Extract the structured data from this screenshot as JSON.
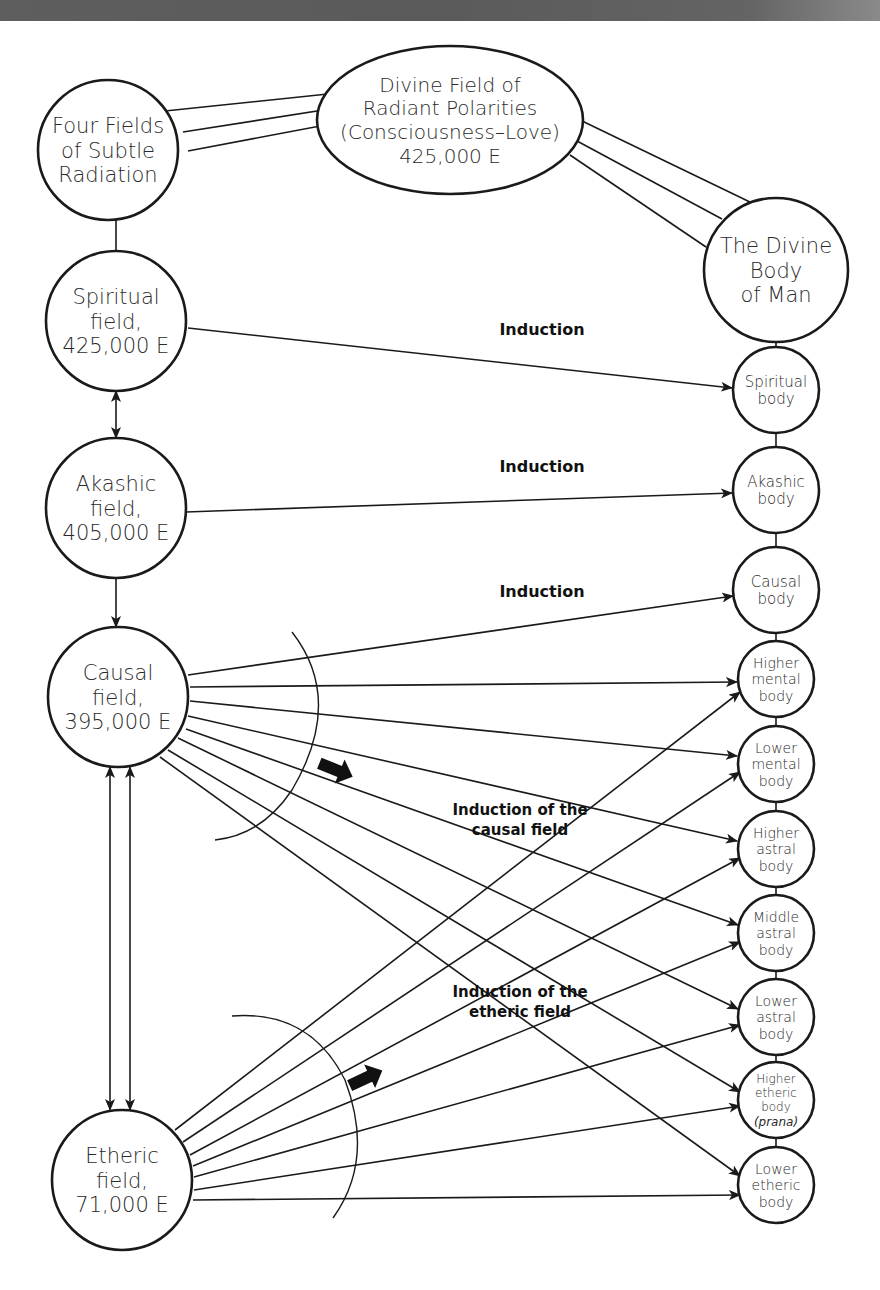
{
  "diagram": {
    "background": "#ffffff",
    "stroke_color": "#1a1a1a",
    "top_band_color": "#5a5a5a",
    "nodes": [
      {
        "id": "four_fields",
        "shape": "circle",
        "cx": 108,
        "cy": 150,
        "r": 70,
        "font_size": 21,
        "lines": [
          "Four Fields",
          "of Subtle",
          "Radiation"
        ]
      },
      {
        "id": "divine_field",
        "shape": "ellipse",
        "cx": 450,
        "cy": 120,
        "rx": 133,
        "ry": 74,
        "font_size": 20,
        "lines": [
          "Divine Field of",
          "Radiant Polarities",
          "(Consciousness–Love)",
          "425,000 E"
        ]
      },
      {
        "id": "divine_body",
        "shape": "circle",
        "cx": 776,
        "cy": 270,
        "r": 72,
        "font_size": 21,
        "lines": [
          "The Divine",
          "Body",
          "of Man"
        ]
      },
      {
        "id": "spiritual_field",
        "shape": "circle",
        "cx": 116,
        "cy": 321,
        "r": 70,
        "font_size": 21,
        "lines": [
          "Spiritual",
          "field,",
          "425,000 E"
        ]
      },
      {
        "id": "akashic_field",
        "shape": "circle",
        "cx": 116,
        "cy": 508,
        "r": 70,
        "font_size": 21,
        "lines": [
          "Akashic",
          "field,",
          "405,000 E"
        ]
      },
      {
        "id": "causal_field",
        "shape": "circle",
        "cx": 118,
        "cy": 697,
        "r": 70,
        "font_size": 21,
        "lines": [
          "Causal",
          "field,",
          "395,000 E"
        ]
      },
      {
        "id": "etheric_field",
        "shape": "circle",
        "cx": 122,
        "cy": 1180,
        "r": 70,
        "font_size": 21,
        "lines": [
          "Etheric",
          "field,",
          "71,000 E"
        ]
      },
      {
        "id": "spiritual_body",
        "shape": "circle",
        "cx": 776,
        "cy": 390,
        "r": 43,
        "font_size": 15,
        "lines": [
          "Spiritual",
          "body"
        ]
      },
      {
        "id": "akashic_body",
        "shape": "circle",
        "cx": 776,
        "cy": 490,
        "r": 43,
        "font_size": 15,
        "lines": [
          "Akashic",
          "body"
        ]
      },
      {
        "id": "causal_body",
        "shape": "circle",
        "cx": 776,
        "cy": 590,
        "r": 43,
        "font_size": 15,
        "lines": [
          "Causal",
          "body"
        ]
      },
      {
        "id": "higher_mental_body",
        "shape": "circle",
        "cx": 776,
        "cy": 679,
        "r": 38,
        "font_size": 14,
        "lines": [
          "Higher",
          "mental",
          "body"
        ]
      },
      {
        "id": "lower_mental_body",
        "shape": "circle",
        "cx": 776,
        "cy": 764,
        "r": 38,
        "font_size": 14,
        "lines": [
          "Lower",
          "mental",
          "body"
        ]
      },
      {
        "id": "higher_astral_body",
        "shape": "circle",
        "cx": 776,
        "cy": 849,
        "r": 38,
        "font_size": 14,
        "lines": [
          "Higher",
          "astral",
          "body"
        ]
      },
      {
        "id": "middle_astral_body",
        "shape": "circle",
        "cx": 776,
        "cy": 933,
        "r": 38,
        "font_size": 14,
        "lines": [
          "Middle",
          "astral",
          "body"
        ]
      },
      {
        "id": "lower_astral_body",
        "shape": "circle",
        "cx": 776,
        "cy": 1017,
        "r": 38,
        "font_size": 14,
        "lines": [
          "Lower",
          "astral",
          "body"
        ]
      },
      {
        "id": "higher_etheric_body",
        "shape": "circle",
        "cx": 776,
        "cy": 1100,
        "r": 38,
        "font_size": 12,
        "lines": [
          "Higher",
          "etheric",
          "body",
          "(prana)"
        ],
        "italic_last": true
      },
      {
        "id": "lower_etheric_body",
        "shape": "circle",
        "cx": 776,
        "cy": 1185,
        "r": 38,
        "font_size": 14,
        "lines": [
          "Lower",
          "etheric",
          "body"
        ]
      }
    ],
    "labels": [
      {
        "id": "induction_1",
        "x": 542,
        "y": 335,
        "font_size": 16,
        "lines": [
          "Induction"
        ]
      },
      {
        "id": "induction_2",
        "x": 542,
        "y": 472,
        "font_size": 16,
        "lines": [
          "Induction"
        ]
      },
      {
        "id": "induction_3",
        "x": 542,
        "y": 597,
        "font_size": 16,
        "lines": [
          "Induction"
        ]
      },
      {
        "id": "induction_causal",
        "x": 520,
        "y": 815,
        "font_size": 15,
        "lines": [
          "Induction of the",
          "causal field"
        ]
      },
      {
        "id": "induction_etheric",
        "x": 520,
        "y": 997,
        "font_size": 15,
        "lines": [
          "Induction of the",
          "etheric field"
        ]
      }
    ],
    "plain_lines": [
      [
        165,
        111,
        347,
        92
      ],
      [
        183,
        132,
        349,
        106
      ],
      [
        188,
        151,
        352,
        120
      ],
      [
        580,
        120,
        752,
        203
      ],
      [
        577,
        141,
        722,
        219
      ],
      [
        570,
        155,
        706,
        247
      ],
      [
        116,
        220,
        116,
        251
      ],
      [
        776,
        342,
        776,
        347
      ],
      [
        776,
        433,
        776,
        447
      ],
      [
        776,
        533,
        776,
        547
      ],
      [
        776,
        633,
        776,
        641
      ],
      [
        776,
        717,
        776,
        726
      ],
      [
        776,
        802,
        776,
        811
      ],
      [
        776,
        887,
        776,
        895
      ],
      [
        776,
        971,
        776,
        979
      ],
      [
        776,
        1055,
        776,
        1062
      ],
      [
        776,
        1138,
        776,
        1147
      ]
    ],
    "arrows": [
      {
        "from": [
          188,
          328
        ],
        "to": [
          732,
          388
        ],
        "ends": "end"
      },
      {
        "from": [
          186,
          512
        ],
        "to": [
          732,
          493
        ],
        "ends": "end"
      },
      {
        "from": [
          116,
          391
        ],
        "to": [
          116,
          438
        ],
        "ends": "both"
      },
      {
        "from": [
          116,
          578
        ],
        "to": [
          116,
          627
        ],
        "ends": "end"
      },
      {
        "from": [
          110,
          1110
        ],
        "to": [
          110,
          767
        ],
        "ends": "both"
      },
      {
        "from": [
          130,
          1110
        ],
        "to": [
          130,
          767
        ],
        "ends": "both"
      },
      {
        "from": [
          188,
          675
        ],
        "to": [
          733,
          596
        ],
        "ends": "end"
      },
      {
        "from": [
          190,
          687
        ],
        "to": [
          737,
          682
        ],
        "ends": "end"
      },
      {
        "from": [
          190,
          701
        ],
        "to": [
          737,
          756
        ],
        "ends": "end"
      },
      {
        "from": [
          188,
          716
        ],
        "to": [
          737,
          841
        ],
        "ends": "end"
      },
      {
        "from": [
          186,
          729
        ],
        "to": [
          738,
          925
        ],
        "ends": "end"
      },
      {
        "from": [
          178,
          738
        ],
        "to": [
          738,
          1009
        ],
        "ends": "end"
      },
      {
        "from": [
          168,
          750
        ],
        "to": [
          740,
          1092
        ],
        "ends": "end"
      },
      {
        "from": [
          160,
          757
        ],
        "to": [
          740,
          1176
        ],
        "ends": "end"
      },
      {
        "from": [
          175,
          1130
        ],
        "to": [
          740,
          692
        ],
        "ends": "end"
      },
      {
        "from": [
          183,
          1142
        ],
        "to": [
          740,
          772
        ],
        "ends": "end"
      },
      {
        "from": [
          190,
          1155
        ],
        "to": [
          740,
          858
        ],
        "ends": "end"
      },
      {
        "from": [
          193,
          1166
        ],
        "to": [
          740,
          942
        ],
        "ends": "end"
      },
      {
        "from": [
          194,
          1177
        ],
        "to": [
          740,
          1025
        ],
        "ends": "end"
      },
      {
        "from": [
          194,
          1190
        ],
        "to": [
          740,
          1106
        ],
        "ends": "end"
      },
      {
        "from": [
          193,
          1200
        ],
        "to": [
          740,
          1195
        ],
        "ends": "end"
      }
    ],
    "arcs": [
      {
        "id": "causal_arc",
        "d": "M 292 632 Q 345 700 292 790 Q 262 835 215 840"
      },
      {
        "id": "etheric_arc",
        "d": "M 232 1016 Q 310 1010 345 1080 Q 375 1160 333 1218"
      }
    ],
    "block_arrows": [
      {
        "id": "causal_flow_arrow",
        "x": 336,
        "y": 770,
        "angle": 22
      },
      {
        "id": "etheric_flow_arrow",
        "x": 366,
        "y": 1078,
        "angle": -25
      }
    ]
  }
}
